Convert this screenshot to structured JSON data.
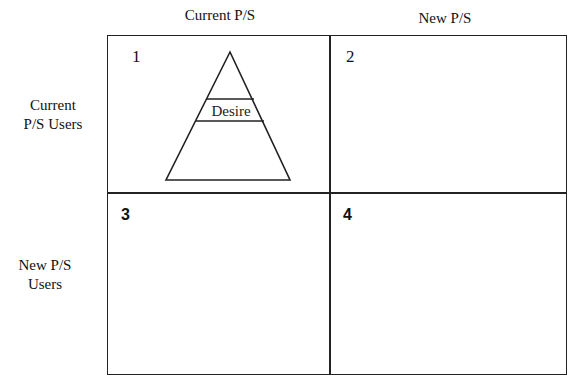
{
  "columns": {
    "current": "Current P/S",
    "new": "New P/S"
  },
  "rows": {
    "current": [
      "Current",
      "P/S Users"
    ],
    "new": [
      "New P/S",
      "Users"
    ]
  },
  "quadrants": [
    {
      "number": "1",
      "content": "pyramid"
    },
    {
      "number": "2",
      "content": ""
    },
    {
      "number": "3",
      "content": ""
    },
    {
      "number": "4",
      "content": ""
    }
  ],
  "pyramid": {
    "band_label": "Desire"
  }
}
